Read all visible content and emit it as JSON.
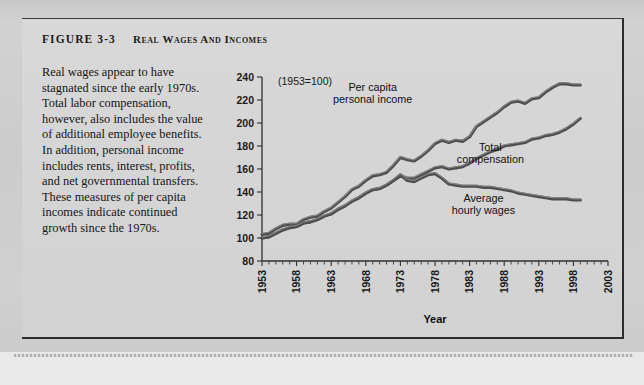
{
  "figure": {
    "label": "Figure 3-3",
    "title": "Real Wages and Incomes",
    "caption": "Real wages appear to have stagnated since the early 1970s. Total labor compensation, however, also includes the value of additional employee benefits. In addition, personal income includes rents, interest, profits, and net governmental transfers. These measures of per capita incomes indicate continued growth since the 1970s."
  },
  "chart_data": {
    "type": "line",
    "title": "Real Wages and Incomes",
    "note": "(1953=100)",
    "xlabel": "Year",
    "ylabel": "",
    "xlim": [
      1953,
      2003
    ],
    "ylim": [
      80,
      240
    ],
    "yticks": [
      80,
      100,
      120,
      140,
      160,
      180,
      200,
      220,
      240
    ],
    "xticks": [
      1953,
      1958,
      1963,
      1968,
      1973,
      1978,
      1983,
      1988,
      1993,
      1998,
      2003
    ],
    "minor_tick_interval": 1,
    "grid": false,
    "legend": "inline-annotations",
    "x": [
      1953,
      1954,
      1955,
      1956,
      1957,
      1958,
      1959,
      1960,
      1961,
      1962,
      1963,
      1964,
      1965,
      1966,
      1967,
      1968,
      1969,
      1970,
      1971,
      1972,
      1973,
      1974,
      1975,
      1976,
      1977,
      1978,
      1979,
      1980,
      1981,
      1982,
      1983,
      1984,
      1985,
      1986,
      1987,
      1988,
      1989,
      1990,
      1991,
      1992,
      1993,
      1994,
      1995,
      1996,
      1997,
      1998,
      1999
    ],
    "series": [
      {
        "name": "Per capita personal income",
        "color": "#4e4e4e",
        "label_x": 1969,
        "label_y": 228,
        "values": [
          103,
          104,
          108,
          111,
          112,
          112,
          116,
          118,
          119,
          123,
          126,
          131,
          136,
          142,
          145,
          150,
          154,
          155,
          157,
          163,
          170,
          168,
          167,
          171,
          176,
          182,
          185,
          183,
          185,
          184,
          188,
          197,
          201,
          205,
          209,
          214,
          218,
          219,
          217,
          221,
          222,
          227,
          231,
          234,
          234,
          233,
          233
        ]
      },
      {
        "name": "Total compensation",
        "color": "#4e4e4e",
        "label_x": 1986,
        "label_y": 176,
        "values": [
          100,
          101,
          104,
          107,
          109,
          110,
          113,
          114,
          116,
          119,
          121,
          125,
          128,
          132,
          135,
          139,
          142,
          143,
          146,
          150,
          154,
          152,
          152,
          155,
          158,
          161,
          162,
          160,
          161,
          162,
          165,
          169,
          172,
          175,
          177,
          180,
          181,
          182,
          183,
          186,
          187,
          189,
          190,
          192,
          195,
          199,
          204
        ]
      },
      {
        "name": "Average hourly wages",
        "color": "#4e4e4e",
        "label_x": 1985,
        "label_y": 131,
        "values": [
          100,
          101,
          104,
          107,
          109,
          110,
          113,
          114,
          116,
          119,
          121,
          125,
          128,
          132,
          135,
          139,
          142,
          143,
          146,
          150,
          155,
          150,
          149,
          152,
          155,
          156,
          152,
          147,
          146,
          145,
          145,
          145,
          144,
          144,
          143,
          142,
          141,
          139,
          138,
          137,
          136,
          135,
          134,
          134,
          134,
          133,
          133
        ]
      }
    ]
  }
}
